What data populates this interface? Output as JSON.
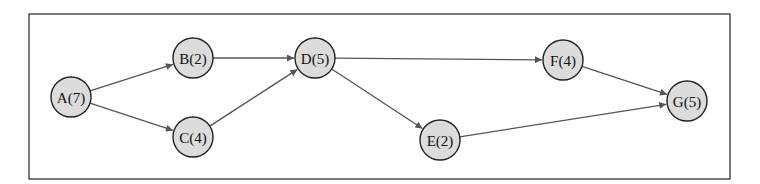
{
  "diagram": {
    "type": "directed-graph",
    "nodes": [
      {
        "id": "A",
        "label": "A(7)",
        "duration": 7,
        "x": 71,
        "y": 97
      },
      {
        "id": "B",
        "label": "B(2)",
        "duration": 2,
        "x": 193,
        "y": 58
      },
      {
        "id": "C",
        "label": "C(4)",
        "duration": 4,
        "x": 193,
        "y": 137
      },
      {
        "id": "D",
        "label": "D(5)",
        "duration": 5,
        "x": 315,
        "y": 58
      },
      {
        "id": "E",
        "label": "E(2)",
        "duration": 2,
        "x": 440,
        "y": 140
      },
      {
        "id": "F",
        "label": "F(4)",
        "duration": 4,
        "x": 563,
        "y": 60
      },
      {
        "id": "G",
        "label": "G(5)",
        "duration": 5,
        "x": 687,
        "y": 101
      }
    ],
    "edges": [
      {
        "from": "A",
        "to": "B"
      },
      {
        "from": "A",
        "to": "C"
      },
      {
        "from": "B",
        "to": "D"
      },
      {
        "from": "C",
        "to": "D"
      },
      {
        "from": "D",
        "to": "F"
      },
      {
        "from": "D",
        "to": "E"
      },
      {
        "from": "F",
        "to": "G"
      },
      {
        "from": "E",
        "to": "G"
      }
    ],
    "colors": {
      "node_fill": "#dcdcdc",
      "node_stroke": "#222222",
      "edge": "#555555",
      "frame": "#333333"
    }
  }
}
